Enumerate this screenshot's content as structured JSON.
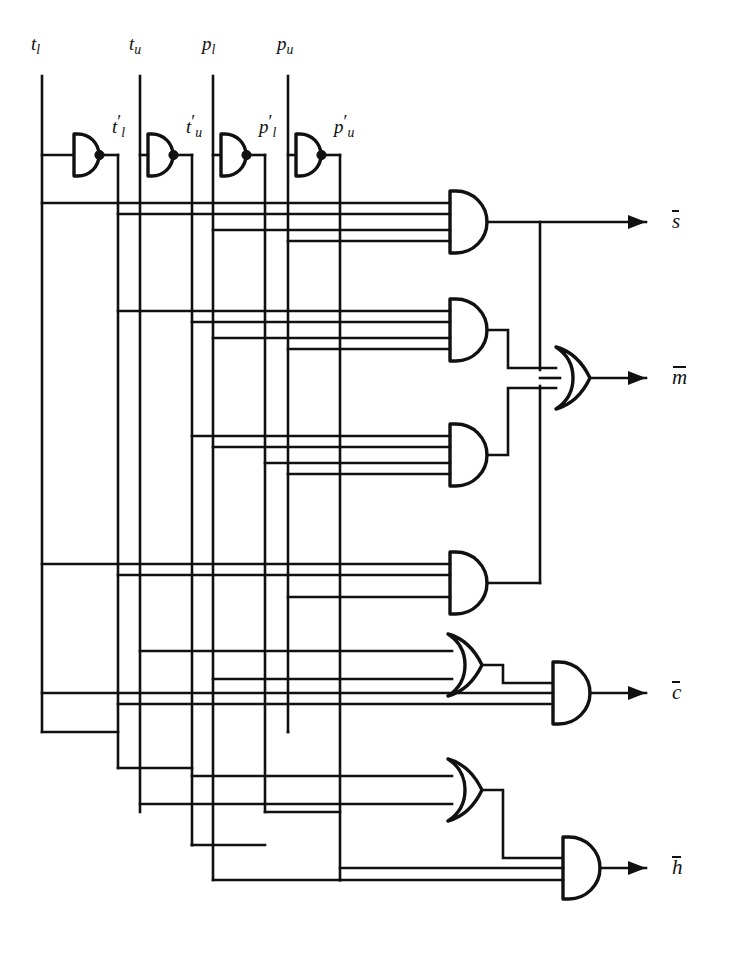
{
  "figure": {
    "kind": "logic-circuit-schematic",
    "title": "",
    "background_color": "#ffffff",
    "line_color": "#111111",
    "width": 735,
    "height": 955
  },
  "inputs": [
    {
      "id": "tl",
      "label_base": "t",
      "label_sub": "l",
      "label_text": "t l",
      "x": 42
    },
    {
      "id": "tu",
      "label_base": "t",
      "label_sub": "u",
      "label_text": "t u",
      "x": 140
    },
    {
      "id": "pl",
      "label_base": "p",
      "label_sub": "l",
      "label_text": "p l",
      "x": 213
    },
    {
      "id": "pu",
      "label_base": "p",
      "label_sub": "u",
      "label_text": "p u",
      "x": 288
    }
  ],
  "inverters": [
    {
      "id": "inv-tl",
      "out_label_base": "t",
      "out_label_sub": "l",
      "out_x": 118
    },
    {
      "id": "inv-tu",
      "out_label_base": "t",
      "out_label_sub": "u",
      "out_x": 192
    },
    {
      "id": "inv-pl",
      "out_label_base": "p",
      "out_label_sub": "l",
      "out_x": 265
    },
    {
      "id": "inv-pu",
      "out_label_base": "p",
      "out_label_sub": "u",
      "out_x": 340
    }
  ],
  "gates": [
    {
      "id": "and-1",
      "type": "and",
      "inputs": 4,
      "feeds": "s-bar"
    },
    {
      "id": "and-2",
      "type": "and",
      "inputs": 4,
      "feeds": "or-m"
    },
    {
      "id": "and-3",
      "type": "and",
      "inputs": 4,
      "feeds": "or-m"
    },
    {
      "id": "and-4",
      "type": "and",
      "inputs": 3,
      "feeds": "or-m"
    },
    {
      "id": "or-m",
      "type": "or",
      "inputs": 3,
      "feeds": "m-bar"
    },
    {
      "id": "or-5",
      "type": "or",
      "inputs": 2,
      "feeds": "and-c"
    },
    {
      "id": "and-c",
      "type": "and",
      "inputs": 3,
      "feeds": "c-bar"
    },
    {
      "id": "or-6",
      "type": "or",
      "inputs": 2,
      "feeds": "and-h"
    },
    {
      "id": "and-h",
      "type": "and",
      "inputs": 3,
      "feeds": "h-bar"
    }
  ],
  "outputs": [
    {
      "id": "s-bar",
      "label_base": "s",
      "y": 222
    },
    {
      "id": "m-bar",
      "label_base": "m",
      "y": 378
    },
    {
      "id": "c-bar",
      "label_base": "c",
      "y": 693
    },
    {
      "id": "h-bar",
      "label_base": "h",
      "y": 868
    }
  ],
  "labels": {
    "input_tl": "t",
    "input_tl_sub": "l",
    "input_tu": "t",
    "input_tu_sub": "u",
    "input_pl": "p",
    "input_pl_sub": "l",
    "input_pu": "p",
    "input_pu_sub": "u",
    "inv_tl": "t",
    "inv_tl_sub": "l",
    "inv_tu": "t",
    "inv_tu_sub": "u",
    "inv_pl": "p",
    "inv_pl_sub": "l",
    "inv_pu": "p",
    "inv_pu_sub": "u",
    "out_s": "s",
    "out_m": "m",
    "out_c": "c",
    "out_h": "h"
  }
}
